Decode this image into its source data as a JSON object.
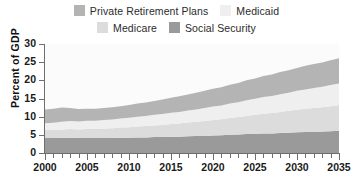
{
  "chart_data": {
    "type": "area",
    "title": "",
    "subtitle": "",
    "xlabel": "",
    "ylabel": "Percent of GDP",
    "xlim": [
      2000,
      2035
    ],
    "ylim": [
      0,
      30
    ],
    "ytick_values": [
      0,
      5,
      10,
      15,
      20,
      25,
      30
    ],
    "ytick_labels": [
      "0",
      "5",
      "10",
      "15",
      "20",
      "25",
      "30"
    ],
    "xtick_values": [
      2000,
      2005,
      2010,
      2015,
      2020,
      2025,
      2030,
      2035
    ],
    "xtick_labels": [
      "2000",
      "2005",
      "2010",
      "2015",
      "2020",
      "2025",
      "2030",
      "2035"
    ],
    "xtick_minor_step": 1,
    "grid": false,
    "stacked": true,
    "legend_position": "top",
    "x": [
      2000,
      2001,
      2002,
      2003,
      2004,
      2005,
      2006,
      2007,
      2008,
      2009,
      2010,
      2011,
      2012,
      2013,
      2014,
      2015,
      2016,
      2017,
      2018,
      2019,
      2020,
      2021,
      2022,
      2023,
      2024,
      2025,
      2026,
      2027,
      2028,
      2029,
      2030,
      2031,
      2032,
      2033,
      2034,
      2035
    ],
    "series": [
      {
        "name": "Social Security",
        "color": "#9a9a9a",
        "values": [
          4.1,
          4.1,
          4.2,
          4.2,
          4.1,
          4.1,
          4.1,
          4.1,
          4.1,
          4.2,
          4.2,
          4.3,
          4.3,
          4.4,
          4.4,
          4.5,
          4.5,
          4.6,
          4.7,
          4.7,
          4.8,
          4.9,
          5.0,
          5.1,
          5.2,
          5.3,
          5.4,
          5.4,
          5.5,
          5.6,
          5.7,
          5.8,
          5.8,
          5.9,
          6.0,
          6.1
        ]
      },
      {
        "name": "Medicare",
        "color": "#dcdcdc",
        "values": [
          2.2,
          2.2,
          2.3,
          2.4,
          2.4,
          2.5,
          2.5,
          2.6,
          2.7,
          2.8,
          2.9,
          3.0,
          3.1,
          3.2,
          3.3,
          3.5,
          3.6,
          3.8,
          3.9,
          4.1,
          4.3,
          4.4,
          4.6,
          4.8,
          5.0,
          5.2,
          5.4,
          5.6,
          5.8,
          6.0,
          6.2,
          6.4,
          6.6,
          6.7,
          6.9,
          7.1
        ]
      },
      {
        "name": "Medicaid",
        "color": "#efefef",
        "values": [
          1.9,
          2.0,
          2.1,
          2.2,
          2.2,
          2.3,
          2.3,
          2.4,
          2.4,
          2.5,
          2.6,
          2.7,
          2.8,
          2.9,
          3.0,
          3.1,
          3.2,
          3.3,
          3.4,
          3.6,
          3.7,
          3.8,
          4.0,
          4.1,
          4.3,
          4.4,
          4.6,
          4.7,
          4.9,
          5.0,
          5.2,
          5.3,
          5.5,
          5.6,
          5.8,
          5.9
        ]
      },
      {
        "name": "Private Retirement Plans",
        "color": "#b4b4b4",
        "values": [
          3.8,
          3.9,
          3.9,
          3.6,
          3.4,
          3.3,
          3.3,
          3.3,
          3.4,
          3.4,
          3.5,
          3.6,
          3.7,
          3.8,
          4.0,
          4.1,
          4.3,
          4.4,
          4.6,
          4.7,
          4.9,
          5.0,
          5.2,
          5.3,
          5.5,
          5.6,
          5.8,
          5.9,
          6.1,
          6.2,
          6.3,
          6.5,
          6.6,
          6.7,
          6.8,
          7.0
        ]
      }
    ],
    "totals": [
      12.0,
      12.2,
      12.5,
      12.4,
      12.1,
      12.2,
      12.2,
      12.4,
      12.6,
      12.9,
      13.2,
      13.6,
      13.9,
      14.3,
      14.7,
      15.2,
      15.6,
      16.1,
      16.6,
      17.1,
      17.7,
      18.1,
      18.8,
      19.3,
      20.0,
      20.5,
      21.2,
      21.6,
      22.3,
      22.8,
      23.4,
      24.0,
      24.5,
      24.9,
      25.5,
      26.1
    ]
  },
  "legend": {
    "rows": [
      [
        {
          "label": "Private Retirement Plans",
          "color": "#b4b4b4"
        },
        {
          "label": "Medicaid",
          "color": "#efefef"
        }
      ],
      [
        {
          "label": "Medicare",
          "color": "#dcdcdc"
        },
        {
          "label": "Social Security",
          "color": "#9a9a9a"
        }
      ]
    ]
  },
  "axes": {
    "y_title": "Percent of GDP"
  }
}
